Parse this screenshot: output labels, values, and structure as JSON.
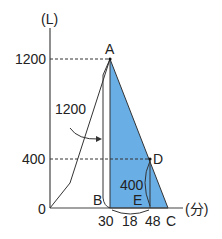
{
  "diagram": {
    "y_unit": "(L)",
    "x_unit": "(分)",
    "y_ticks": [
      {
        "label": "1200",
        "value": 1200
      },
      {
        "label": "400",
        "value": 400
      },
      {
        "label": "0",
        "value": 0
      }
    ],
    "points": {
      "A": "A",
      "B": "B",
      "C": "C",
      "D": "D",
      "E": "E"
    },
    "x_labels": [
      "30",
      "18",
      "48"
    ],
    "annotations": {
      "brace_area": "1200",
      "brace_de": "400"
    },
    "colors": {
      "fill": "#6aaee6",
      "line": "#333333"
    }
  }
}
